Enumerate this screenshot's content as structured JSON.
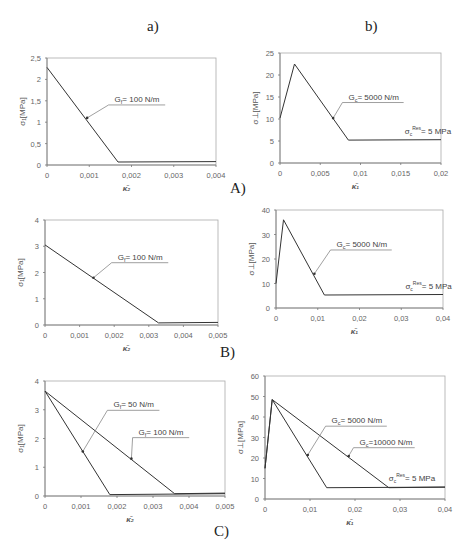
{
  "column_labels": {
    "a": "a)",
    "b": "b)"
  },
  "row_labels": {
    "A": "A)",
    "B": "B)",
    "C": "C)"
  },
  "chart_data": [
    {
      "id": "A-a",
      "type": "line",
      "title": "",
      "xlabel": "κ̄₂",
      "ylabel": "σ₁[MPa]",
      "xlim": [
        0,
        0.004
      ],
      "ylim": [
        0,
        2.5
      ],
      "xticks": [
        "0",
        "0,001",
        "0,002",
        "0,003",
        "0,004"
      ],
      "yticks": [
        "0",
        "0,5",
        "1",
        "1,5",
        "2",
        "2,5"
      ],
      "xtick_values": [
        0,
        0.001,
        0.002,
        0.003,
        0.004
      ],
      "ytick_values": [
        0,
        0.5,
        1,
        1.5,
        2,
        2.5
      ],
      "grid": false,
      "series": [
        {
          "name": "G_f = 100 N/m",
          "x": [
            0,
            0.00168,
            0.004
          ],
          "y": [
            2.28,
            0.07,
            0.08
          ]
        }
      ],
      "annotations": [
        {
          "text": "Gf= 100 N/m",
          "target_series": 0,
          "at": [
            0.00095,
            1.1
          ],
          "label_at": [
            0.0016,
            1.45
          ]
        }
      ]
    },
    {
      "id": "A-b",
      "type": "line",
      "title": "",
      "xlabel": "κ̄₁",
      "ylabel": "σ⊥[MPa]",
      "xlim": [
        0,
        0.02
      ],
      "ylim": [
        0,
        25
      ],
      "xticks": [
        "0",
        "0,005",
        "0,01",
        "0,015",
        "0,02"
      ],
      "yticks": [
        "0",
        "5",
        "10",
        "15",
        "20",
        "25"
      ],
      "xtick_values": [
        0,
        0.005,
        0.01,
        0.015,
        0.02
      ],
      "ytick_values": [
        0,
        5,
        10,
        15,
        20,
        25
      ],
      "grid": false,
      "series": [
        {
          "name": "G_c = 5000 N/m",
          "x": [
            0,
            0.0018,
            0.0085,
            0.02
          ],
          "y": [
            10.2,
            22.5,
            5.2,
            5.3
          ]
        }
      ],
      "annotations": [
        {
          "text": "Gc= 5000 N/m",
          "target_series": 0,
          "at": [
            0.0066,
            10.2
          ],
          "label_at": [
            0.0085,
            14.2
          ]
        },
        {
          "text": "σc Res= 5 MPa",
          "target_series": 0,
          "at": [
            0.0155,
            5.3
          ],
          "label_at": [
            0.0155,
            6.3
          ]
        }
      ]
    },
    {
      "id": "B-a",
      "type": "line",
      "title": "",
      "xlabel": "κ̄₂",
      "ylabel": "σ₁[MPa]",
      "xlim": [
        0,
        0.005
      ],
      "ylim": [
        0,
        4
      ],
      "xticks": [
        "0",
        "0,001",
        "0,002",
        "0,003",
        "0,004",
        "0,005"
      ],
      "yticks": [
        "0",
        "1",
        "2",
        "3",
        "4"
      ],
      "xtick_values": [
        0,
        0.001,
        0.002,
        0.003,
        0.004,
        0.005
      ],
      "ytick_values": [
        0,
        1,
        2,
        3,
        4
      ],
      "grid": false,
      "series": [
        {
          "name": "G_f = 100 N/m",
          "x": [
            0,
            0.00328,
            0.005
          ],
          "y": [
            3.05,
            0.08,
            0.1
          ]
        }
      ],
      "annotations": [
        {
          "text": "Gf= 100 N/m",
          "target_series": 0,
          "at": [
            0.0014,
            1.8
          ],
          "label_at": [
            0.0021,
            2.45
          ]
        }
      ]
    },
    {
      "id": "B-b",
      "type": "line",
      "title": "",
      "xlabel": "κ̄₁",
      "ylabel": "σ⊥[MPa]",
      "xlim": [
        0,
        0.04
      ],
      "ylim": [
        0,
        40
      ],
      "xticks": [
        "0",
        "0,01",
        "0,02",
        "0,03",
        "0,04"
      ],
      "yticks": [
        "0",
        "10",
        "20",
        "30",
        "40"
      ],
      "xtick_values": [
        0,
        0.01,
        0.02,
        0.03,
        0.04
      ],
      "ytick_values": [
        0,
        10,
        20,
        30,
        40
      ],
      "grid": false,
      "series": [
        {
          "name": "G_c = 5000 N/m",
          "x": [
            0,
            0.0018,
            0.0116,
            0.04
          ],
          "y": [
            10,
            36,
            5.3,
            5.5
          ]
        }
      ],
      "annotations": [
        {
          "text": "Gc= 5000 N/m",
          "target_series": 0,
          "at": [
            0.0092,
            14
          ],
          "label_at": [
            0.0145,
            24.5
          ]
        },
        {
          "text": "σc Res= 5 MPa",
          "target_series": 0,
          "at": [
            0.031,
            5.5
          ],
          "label_at": [
            0.031,
            7.2
          ]
        }
      ]
    },
    {
      "id": "C-a",
      "type": "line",
      "title": "",
      "xlabel": "κ̄₂",
      "ylabel": "σ₁[MPa]",
      "xlim": [
        0,
        0.005
      ],
      "ylim": [
        0,
        4
      ],
      "xticks": [
        "0",
        "0,001",
        "0,002",
        "0,003",
        "0,004",
        "0,005"
      ],
      "yticks": [
        "0",
        "1",
        "2",
        "3",
        "4"
      ],
      "xtick_values": [
        0,
        0.001,
        0.002,
        0.003,
        0.004,
        0.005
      ],
      "ytick_values": [
        0,
        1,
        2,
        3,
        4
      ],
      "grid": false,
      "series": [
        {
          "name": "G_f = 50 N/m",
          "x": [
            0,
            0.0018,
            0.005
          ],
          "y": [
            3.65,
            0.05,
            0.08
          ]
        },
        {
          "name": "G_f = 100 N/m",
          "x": [
            0,
            0.0036,
            0.005
          ],
          "y": [
            3.65,
            0.08,
            0.1
          ]
        }
      ],
      "annotations": [
        {
          "text": "Gf= 50 N/m",
          "target_series": 0,
          "at": [
            0.00105,
            1.55
          ],
          "label_at": [
            0.0019,
            3.05
          ]
        },
        {
          "text": "Gf= 100 N/m",
          "target_series": 1,
          "at": [
            0.0024,
            1.3
          ],
          "label_at": [
            0.0026,
            2.1
          ]
        }
      ]
    },
    {
      "id": "C-b",
      "type": "line",
      "title": "",
      "xlabel": "κ̄₁",
      "ylabel": "σ⊥[MPa]",
      "xlim": [
        0,
        0.04
      ],
      "ylim": [
        0,
        60
      ],
      "xticks": [
        "0",
        "0,01",
        "0,02",
        "0,03",
        "0,04"
      ],
      "yticks": [
        "0",
        "10",
        "20",
        "30",
        "40",
        "50",
        "60"
      ],
      "xtick_values": [
        0,
        0.01,
        0.02,
        0.03,
        0.04
      ],
      "ytick_values": [
        0,
        10,
        20,
        30,
        40,
        50,
        60
      ],
      "grid": false,
      "series": [
        {
          "name": "G_c = 5000 N/m",
          "x": [
            0,
            0.0016,
            0.0137,
            0.04
          ],
          "y": [
            15,
            48.5,
            5.5,
            5.8
          ]
        },
        {
          "name": "G_c = 10000 N/m",
          "x": [
            0,
            0.0016,
            0.0275,
            0.04
          ],
          "y": [
            15,
            48.5,
            5.5,
            5.8
          ]
        }
      ],
      "annotations": [
        {
          "text": "Gc= 5000 N/m",
          "target_series": 0,
          "at": [
            0.0095,
            21.5
          ],
          "label_at": [
            0.0148,
            36.5
          ]
        },
        {
          "text": "Gc=10000 N/m",
          "target_series": 1,
          "at": [
            0.0186,
            21
          ],
          "label_at": [
            0.021,
            26
          ]
        },
        {
          "text": "σc Res= 5 MPa",
          "target_series": 1,
          "at": [
            0.027,
            5.8
          ],
          "label_at": [
            0.0275,
            8.5
          ]
        }
      ]
    }
  ]
}
